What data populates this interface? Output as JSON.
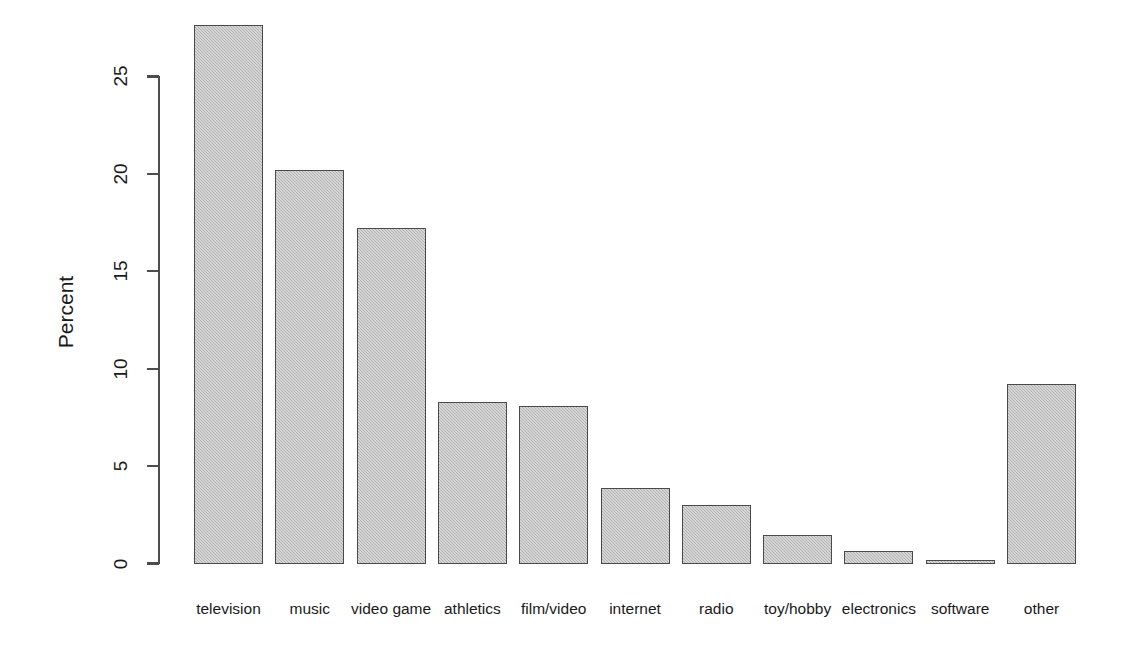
{
  "chart_data": {
    "type": "bar",
    "title": "",
    "subtitle": "",
    "xlabel": "",
    "ylabel": "Percent",
    "ylim": [
      0,
      28
    ],
    "y_ticks": [
      0,
      5,
      10,
      15,
      20,
      25
    ],
    "y_tick_labels": [
      "0",
      "5",
      "10",
      "15",
      "20",
      "25"
    ],
    "grid": false,
    "legend": null,
    "legend_position": "none",
    "axis_style": "r-default-left-axis-with-outward-ticks",
    "categories": [
      "television",
      "music",
      "video game",
      "athletics",
      "film/video",
      "internet",
      "radio",
      "toy/hobby",
      "electronics",
      "software",
      "other"
    ],
    "values": [
      27.6,
      20.2,
      17.2,
      8.3,
      8.1,
      3.9,
      3.0,
      1.5,
      0.65,
      0.2,
      9.2
    ],
    "bar_fill_color": "#b9b9b9",
    "bar_border_color": "#4a4a4a",
    "background_color": "#ffffff",
    "text_color": "#1a1a1a"
  },
  "axis": {
    "y_title": "Percent"
  }
}
